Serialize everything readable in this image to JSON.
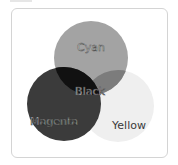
{
  "diagram": {
    "type": "venn",
    "circles": [
      {
        "name": "cyan",
        "label": "Cyan",
        "cx": 91,
        "cy": 58,
        "r": 37,
        "color": "#a3a3a3"
      },
      {
        "name": "magenta",
        "label": "Magenta",
        "cx": 64,
        "cy": 104,
        "r": 37,
        "color": "#3b3b3b"
      },
      {
        "name": "yellow",
        "label": "Yellow",
        "cx": 118,
        "cy": 106,
        "r": 36,
        "color": "#efefef"
      }
    ],
    "intersections": {
      "cyan_magenta": {
        "label": "Black",
        "color": "#111111"
      },
      "cyan_yellow": {
        "color": "#7c7c7c"
      },
      "magenta_yellow": {
        "color": "#3b3b3b"
      }
    },
    "labels": {
      "cyan": "Cyan",
      "black": "Black",
      "magenta": "Magenta",
      "yellow": "Yellow"
    }
  }
}
